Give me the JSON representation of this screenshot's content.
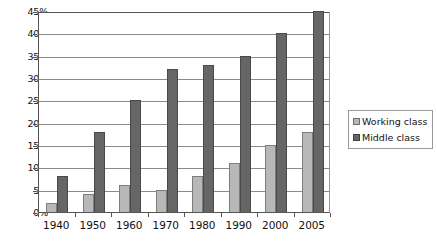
{
  "chart_data": {
    "type": "bar",
    "title": "",
    "subtitle": "",
    "xlabel": "",
    "ylabel": "",
    "grid": true,
    "legend_position": "right",
    "ylim": [
      0,
      45
    ],
    "ytick_step": 5,
    "ytick_labels": [
      "45%",
      "40%",
      "35%",
      "30%",
      "25%",
      "20%",
      "15%",
      "10%",
      "5%",
      "0%"
    ],
    "ytick_values": [
      45,
      40,
      35,
      30,
      25,
      20,
      15,
      10,
      5,
      0
    ],
    "categories": [
      "1940",
      "1950",
      "1960",
      "1970",
      "1980",
      "1990",
      "2000",
      "2005"
    ],
    "series": [
      {
        "name": "Working class",
        "color": "#b8b8b8",
        "values": [
          2,
          4,
          6,
          5,
          8,
          11,
          15,
          18
        ]
      },
      {
        "name": "Middle class",
        "color": "#666666",
        "values": [
          8,
          18,
          25,
          32,
          33,
          35,
          40,
          45
        ]
      }
    ]
  },
  "legend": {
    "items": [
      {
        "label": "Working class",
        "swatch": "working"
      },
      {
        "label": "Middle class",
        "swatch": "middle"
      }
    ]
  }
}
